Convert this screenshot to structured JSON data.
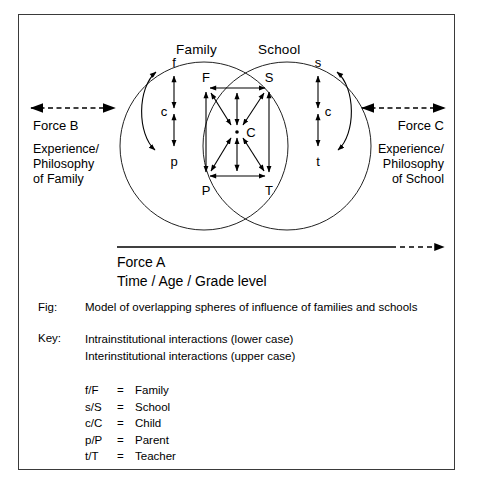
{
  "diagram": {
    "spheres": [
      {
        "id": "family",
        "label": "Family"
      },
      {
        "id": "school",
        "label": "School"
      }
    ],
    "force_left": {
      "name": "Force B",
      "sub_lines": [
        "Experience/",
        "Philosophy",
        "of Family"
      ],
      "arrow": "dashed-double-arrow"
    },
    "force_right": {
      "name": "Force C",
      "sub_lines": [
        "Experience/",
        "Philosophy",
        "of School"
      ],
      "arrow": "dashed-double-arrow"
    },
    "force_axis": {
      "name": "Force A",
      "sub": "Time / Age / Grade level",
      "arrow": "solid-to-dashed-right-arrow"
    },
    "intra_family_nodes": [
      "f",
      "c",
      "p"
    ],
    "intra_school_nodes": [
      "s",
      "c",
      "t"
    ],
    "inter_nodes": {
      "top_left": "F",
      "top_right": "S",
      "center": "C",
      "bottom_left": "P",
      "bottom_right": "T"
    }
  },
  "caption": {
    "fig_label": "Fig:",
    "fig_text": "Model of overlapping spheres of influence of families and schools",
    "key_label": "Key:",
    "key_lines": [
      "Intrainstitutional interactions (lower case)",
      "Interinstitutional interactions (upper case)"
    ]
  },
  "legend": {
    "rows": [
      {
        "symbol": "f/F",
        "eq": "=",
        "meaning": "Family"
      },
      {
        "symbol": "s/S",
        "eq": "=",
        "meaning": "School"
      },
      {
        "symbol": "c/C",
        "eq": "=",
        "meaning": "Child"
      },
      {
        "symbol": "p/P",
        "eq": "=",
        "meaning": "Parent"
      },
      {
        "symbol": "t/T",
        "eq": "=",
        "meaning": "Teacher"
      }
    ]
  },
  "colors": {
    "ink": "#000000",
    "frame": "#3a3a3a",
    "page": "#ffffff"
  }
}
